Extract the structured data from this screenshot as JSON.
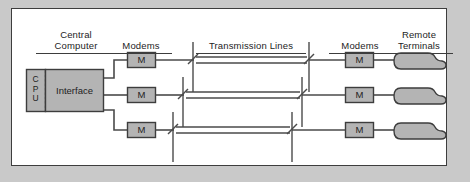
{
  "figure": {
    "background_color": "#c9c9c9",
    "panel_color": "#ffffff",
    "border_color": "#3d3d3d",
    "fill_color": "#b4b4b4",
    "line_color": "#4a4a4a"
  },
  "labels": {
    "central_computer": "Central\nComputer",
    "modems_left": "Modems",
    "transmission_lines": "Transmission Lines",
    "modems_right": "Modems",
    "remote_terminals": "Remote\nTerminals"
  },
  "cpu": {
    "letters": "C\nP\nU"
  },
  "interface": {
    "label": "Interface"
  },
  "modems": {
    "symbol": "M",
    "left": [
      {
        "id": "modem-left-1",
        "symbol": "M"
      },
      {
        "id": "modem-left-2",
        "symbol": "M"
      },
      {
        "id": "modem-left-3",
        "symbol": "M"
      }
    ],
    "right": [
      {
        "id": "modem-right-1",
        "symbol": "M"
      },
      {
        "id": "modem-right-2",
        "symbol": "M"
      },
      {
        "id": "modem-right-3",
        "symbol": "M"
      }
    ]
  },
  "terminals": [
    {
      "id": "remote-terminal-1"
    },
    {
      "id": "remote-terminal-2"
    },
    {
      "id": "remote-terminal-3"
    }
  ],
  "rows": [
    {
      "y": 60,
      "break_left_x": 190,
      "break_right_x": 310
    },
    {
      "y": 95,
      "break_left_x": 180,
      "break_right_x": 303
    },
    {
      "y": 130,
      "break_left_x": 170,
      "break_right_x": 293
    }
  ]
}
